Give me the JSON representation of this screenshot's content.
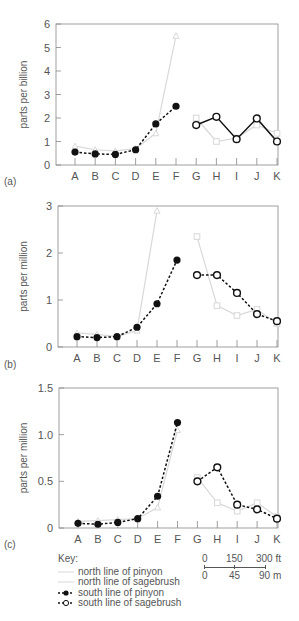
{
  "chart_data": [
    {
      "type": "line",
      "panel": "(a)",
      "ylabel": "parts per billion",
      "ylim": [
        0,
        6
      ],
      "yticks": [
        0,
        1,
        2,
        3,
        4,
        5,
        6
      ],
      "categories": [
        "A",
        "B",
        "C",
        "D",
        "E",
        "F",
        "G",
        "H",
        "I",
        "J",
        "K"
      ],
      "series": [
        {
          "name": "north line of pinyon",
          "style": "light-gray-solid-triangle",
          "values": [
            0.8,
            0.65,
            0.6,
            0.7,
            1.35,
            5.5,
            null,
            null,
            null,
            null,
            null
          ]
        },
        {
          "name": "north line of sagebrush",
          "style": "light-gray-solid-square",
          "values": [
            null,
            null,
            null,
            null,
            null,
            null,
            2.0,
            1.0,
            1.15,
            1.7,
            1.35
          ]
        },
        {
          "name": "south line of pinyon",
          "style": "black-dashed-filled-circle",
          "values": [
            0.55,
            0.47,
            0.45,
            0.65,
            1.75,
            2.5,
            null,
            null,
            null,
            null,
            null
          ]
        },
        {
          "name": "south line of sagebrush",
          "style": "black-solid-open-circle",
          "values": [
            null,
            null,
            null,
            null,
            null,
            null,
            1.7,
            2.05,
            1.1,
            1.98,
            1.0
          ]
        }
      ]
    },
    {
      "type": "line",
      "panel": "(b)",
      "ylabel": "parts per million",
      "ylim": [
        0,
        3
      ],
      "yticks": [
        0,
        1,
        2,
        3
      ],
      "categories": [
        "A",
        "B",
        "C",
        "D",
        "E",
        "F",
        "G",
        "H",
        "I",
        "J",
        "K"
      ],
      "series": [
        {
          "name": "north line of pinyon",
          "style": "light-gray-solid-triangle",
          "values": [
            0.3,
            0.27,
            0.22,
            0.35,
            2.9,
            null,
            null,
            null,
            null,
            null,
            null
          ]
        },
        {
          "name": "north line of sagebrush",
          "style": "light-gray-solid-square",
          "values": [
            null,
            null,
            null,
            null,
            null,
            null,
            2.35,
            0.88,
            0.67,
            0.8,
            0.5
          ]
        },
        {
          "name": "south line of pinyon",
          "style": "black-dashed-filled-circle",
          "values": [
            0.22,
            0.2,
            0.22,
            0.42,
            0.92,
            1.85,
            null,
            null,
            null,
            null,
            null
          ]
        },
        {
          "name": "south line of sagebrush",
          "style": "black-dashed-open-circle",
          "values": [
            null,
            null,
            null,
            null,
            null,
            null,
            1.53,
            1.53,
            1.15,
            0.7,
            0.55
          ]
        }
      ]
    },
    {
      "type": "line",
      "panel": "(c)",
      "ylabel": "parts per million",
      "ylim": [
        0,
        1.5
      ],
      "yticks": [
        "0",
        "0.5",
        "1.0",
        "1.5"
      ],
      "categories": [
        "A",
        "B",
        "C",
        "D",
        "E",
        "F",
        "G",
        "H",
        "I",
        "J",
        "K"
      ],
      "series": [
        {
          "name": "north line of pinyon",
          "style": "light-gray-solid-triangle",
          "values": [
            0.07,
            0.08,
            0.09,
            0.1,
            0.22,
            1.05,
            null,
            null,
            null,
            null,
            null
          ]
        },
        {
          "name": "north line of sagebrush",
          "style": "light-gray-solid-square",
          "values": [
            null,
            null,
            null,
            null,
            null,
            null,
            0.54,
            0.27,
            0.18,
            0.27,
            0.12
          ]
        },
        {
          "name": "south line of pinyon",
          "style": "black-dashed-filled-circle",
          "values": [
            0.05,
            0.04,
            0.06,
            0.1,
            0.34,
            1.13,
            null,
            null,
            null,
            null,
            null
          ]
        },
        {
          "name": "south line of sagebrush",
          "style": "black-dashed-open-circle",
          "values": [
            null,
            null,
            null,
            null,
            null,
            null,
            0.5,
            0.65,
            0.25,
            0.2,
            0.1
          ]
        }
      ]
    }
  ],
  "key": {
    "title": "Key:",
    "items": [
      {
        "label": "north line of pinyon"
      },
      {
        "label": "north line of sagebrush"
      },
      {
        "label": "south line of pinyon"
      },
      {
        "label": "south line of sagebrush"
      }
    ]
  },
  "scale_bar": {
    "top_labels": [
      "0",
      "150",
      "300 ft"
    ],
    "bottom_labels": [
      "0",
      "45",
      "90 m"
    ]
  },
  "colors": {
    "south_lines": "#111111",
    "north_lines": "#d8d8d8",
    "axis": "#888888",
    "text": "#555555"
  }
}
